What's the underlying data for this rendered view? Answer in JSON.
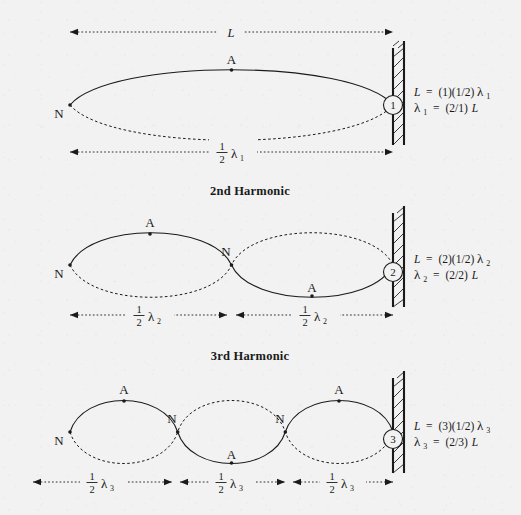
{
  "figure": {
    "title_implicit_first": "",
    "wall_label": "fixed-end wall",
    "length_symbol": "L",
    "lambda_glyph": "λ",
    "fraction_numerator": "1",
    "fraction_denominator": "2"
  },
  "harmonics": [
    {
      "id": "first",
      "heading": "",
      "has_heading": false,
      "circle_number": "1",
      "node_count": 2,
      "antinode_count": 1,
      "half_wavelength_segments": 1,
      "formula_L": "L = (1)(1/2)λ₁",
      "formula_lambda": "λ₁ = (2/1)L",
      "formula_L_parts": {
        "lhs": "L",
        "eq": "=",
        "rhs": "(1)(1/2)",
        "lambda": "λ",
        "sub": "1"
      },
      "formula_lambda_parts": {
        "lambda": "λ",
        "sub": "1",
        "eq": "=",
        "rhs": "(2/1)",
        "tail": "L"
      },
      "top_dim_label": "L",
      "bottom_dim_labels": [
        "½ λ₁"
      ],
      "node_labels": [
        "N"
      ],
      "antinode_labels": [
        "A"
      ],
      "lambda_subscript": "1"
    },
    {
      "id": "second",
      "heading": "2nd Harmonic",
      "has_heading": true,
      "circle_number": "2",
      "node_count": 3,
      "antinode_count": 2,
      "half_wavelength_segments": 2,
      "formula_L": "L = (2)(1/2)λ₂",
      "formula_lambda": "λ₂ = (2/2)L",
      "formula_L_parts": {
        "lhs": "L",
        "eq": "=",
        "rhs": "(2)(1/2)",
        "lambda": "λ",
        "sub": "2"
      },
      "formula_lambda_parts": {
        "lambda": "λ",
        "sub": "2",
        "eq": "=",
        "rhs": "(2/2)",
        "tail": "L"
      },
      "top_dim_label": "",
      "bottom_dim_labels": [
        "½ λ₂",
        "½ λ₂"
      ],
      "node_labels": [
        "N",
        "N"
      ],
      "antinode_labels": [
        "A",
        "A"
      ],
      "lambda_subscript": "2"
    },
    {
      "id": "third",
      "heading": "3rd Harmonic",
      "has_heading": true,
      "circle_number": "3",
      "node_count": 4,
      "antinode_count": 3,
      "half_wavelength_segments": 3,
      "formula_L": "L = (3)(1/2)λ₃",
      "formula_lambda": "λ₃ = (2/3)L",
      "formula_L_parts": {
        "lhs": "L",
        "eq": "=",
        "rhs": "(3)(1/2)",
        "lambda": "λ",
        "sub": "3"
      },
      "formula_lambda_parts": {
        "lambda": "λ",
        "sub": "3",
        "eq": "=",
        "rhs": "(2/3)",
        "tail": "L"
      },
      "top_dim_label": "",
      "bottom_dim_labels": [
        "½ λ₃",
        "½ λ₃",
        "½ λ₃"
      ],
      "node_labels": [
        "N",
        "N",
        "N"
      ],
      "antinode_labels": [
        "A",
        "A",
        "A"
      ],
      "lambda_subscript": "3"
    }
  ],
  "colors": {
    "ink": "#1a1a1a",
    "paper": "#f2f2f2"
  }
}
